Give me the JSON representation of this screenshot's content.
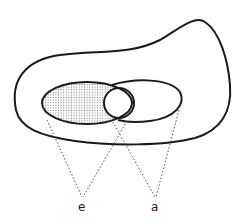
{
  "diagram": {
    "labels": {
      "e": "e",
      "a": "a"
    },
    "colors": {
      "stroke": "#1a1a1a",
      "stipple": "#8a8a8a",
      "background": "#ffffff",
      "dashed_line": "#555555"
    },
    "shapes": [
      {
        "id": "outer-region",
        "type": "blob"
      },
      {
        "id": "set-e",
        "type": "ellipse",
        "fill": "stippled"
      },
      {
        "id": "set-a",
        "type": "ellipse",
        "fill": "none"
      },
      {
        "id": "overlap-circle",
        "type": "circle",
        "fill": "none"
      }
    ],
    "projections": [
      {
        "to": "e",
        "from": "left edge of stippled ellipse"
      },
      {
        "to": "e",
        "from": "right edge of overlap circle"
      },
      {
        "to": "a",
        "from": "lower edge of overlap circle"
      },
      {
        "to": "a",
        "from": "right edge of right ellipse"
      }
    ]
  }
}
